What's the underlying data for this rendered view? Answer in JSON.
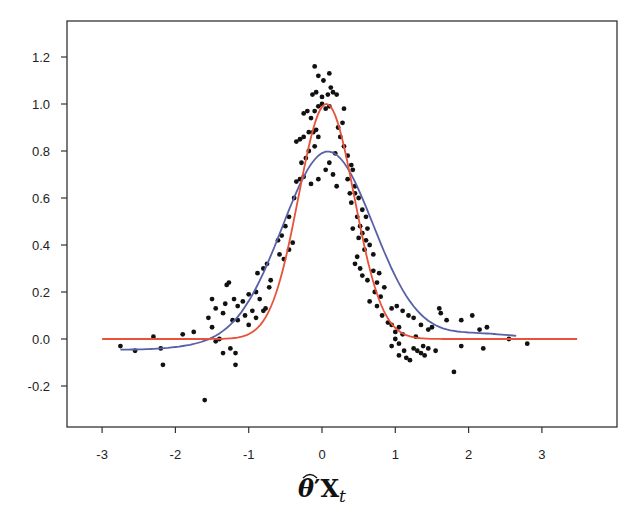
{
  "chart_data": {
    "type": "scatter",
    "title": "",
    "xlabel": "θ̂′X_t",
    "ylabel": "",
    "xlim": [
      -3.45,
      4.0
    ],
    "ylim": [
      -0.38,
      1.36
    ],
    "xticks": [
      -3,
      -2,
      -1,
      0,
      1,
      2,
      3
    ],
    "yticks": [
      -0.2,
      0.0,
      0.2,
      0.4,
      0.6,
      0.8,
      1.0,
      1.2
    ],
    "ytick_labels": [
      "-0.2",
      "0.0",
      "0.2",
      "0.4",
      "0.6",
      "0.8",
      "1.0",
      "1.2"
    ],
    "xtick_labels": [
      "-3",
      "-2",
      "-1",
      "0",
      "1",
      "2",
      "3"
    ],
    "grid": false,
    "legend": null,
    "series": [
      {
        "name": "observations",
        "kind": "scatter",
        "color": "#111111",
        "points": [
          [
            -2.75,
            -0.03
          ],
          [
            -2.55,
            -0.05
          ],
          [
            -2.3,
            0.01
          ],
          [
            -2.2,
            -0.04
          ],
          [
            -2.17,
            -0.11
          ],
          [
            -1.9,
            0.02
          ],
          [
            -1.6,
            -0.26
          ],
          [
            -1.75,
            0.03
          ],
          [
            -1.5,
            0.05
          ],
          [
            -1.45,
            -0.01
          ],
          [
            -1.4,
            0.0
          ],
          [
            -1.35,
            -0.06
          ],
          [
            -1.25,
            -0.04
          ],
          [
            -1.18,
            -0.06
          ],
          [
            -1.18,
            -0.11
          ],
          [
            -1.35,
            0.11
          ],
          [
            -1.2,
            0.17
          ],
          [
            -1.15,
            0.14
          ],
          [
            -1.08,
            0.16
          ],
          [
            -1.0,
            0.19
          ],
          [
            -0.9,
            0.2
          ],
          [
            -1.3,
            0.23
          ],
          [
            -1.27,
            0.24
          ],
          [
            -1.32,
            0.15
          ],
          [
            -1.22,
            0.08
          ],
          [
            -1.15,
            0.08
          ],
          [
            -1.05,
            0.1
          ],
          [
            -1.0,
            0.06
          ],
          [
            -0.95,
            0.12
          ],
          [
            -0.9,
            0.09
          ],
          [
            -1.5,
            0.17
          ],
          [
            -1.45,
            0.13
          ],
          [
            -1.55,
            0.09
          ],
          [
            -0.88,
            0.28
          ],
          [
            -0.8,
            0.3
          ],
          [
            -0.75,
            0.32
          ],
          [
            -0.7,
            0.25
          ],
          [
            -0.72,
            0.22
          ],
          [
            -0.85,
            0.17
          ],
          [
            -0.8,
            0.12
          ],
          [
            -0.77,
            0.13
          ],
          [
            -0.6,
            0.42
          ],
          [
            -0.55,
            0.44
          ],
          [
            -0.5,
            0.48
          ],
          [
            -0.58,
            0.36
          ],
          [
            -0.45,
            0.38
          ],
          [
            -0.4,
            0.41
          ],
          [
            -0.52,
            0.34
          ],
          [
            -0.45,
            0.52
          ],
          [
            -0.38,
            0.6
          ],
          [
            -0.35,
            0.67
          ],
          [
            -0.3,
            0.68
          ],
          [
            -0.25,
            0.69
          ],
          [
            -0.28,
            0.75
          ],
          [
            -0.22,
            0.77
          ],
          [
            -0.18,
            0.8
          ],
          [
            -0.1,
            0.82
          ],
          [
            -0.05,
            0.86
          ],
          [
            -0.18,
            0.88
          ],
          [
            -0.12,
            0.88
          ],
          [
            -0.08,
            0.89
          ],
          [
            -0.3,
            0.85
          ],
          [
            -0.25,
            0.86
          ],
          [
            -0.35,
            0.84
          ],
          [
            -0.15,
            0.94
          ],
          [
            -0.1,
            0.97
          ],
          [
            -0.05,
            0.99
          ],
          [
            0.0,
            1.0
          ],
          [
            -0.2,
            0.97
          ],
          [
            -0.25,
            0.96
          ],
          [
            0.05,
            0.98
          ],
          [
            0.1,
            0.99
          ],
          [
            -0.13,
            1.04
          ],
          [
            -0.08,
            1.05
          ],
          [
            0.0,
            1.03
          ],
          [
            0.08,
            1.04
          ],
          [
            0.12,
            1.07
          ],
          [
            0.2,
            1.04
          ],
          [
            -0.1,
            1.16
          ],
          [
            -0.05,
            1.12
          ],
          [
            0.02,
            1.1
          ],
          [
            0.1,
            1.13
          ],
          [
            0.15,
            1.05
          ],
          [
            0.3,
            0.98
          ],
          [
            0.28,
            0.92
          ],
          [
            0.22,
            0.9
          ],
          [
            0.25,
            0.86
          ],
          [
            0.3,
            0.82
          ],
          [
            0.35,
            0.78
          ],
          [
            0.18,
            0.79
          ],
          [
            0.05,
            0.72
          ],
          [
            0.1,
            0.75
          ],
          [
            0.15,
            0.7
          ],
          [
            -0.05,
            0.68
          ],
          [
            -0.15,
            0.66
          ],
          [
            0.2,
            0.65
          ],
          [
            0.35,
            0.68
          ],
          [
            0.4,
            0.74
          ],
          [
            0.42,
            0.72
          ],
          [
            0.45,
            0.65
          ],
          [
            0.38,
            0.62
          ],
          [
            0.45,
            0.62
          ],
          [
            0.5,
            0.6
          ],
          [
            0.4,
            0.58
          ],
          [
            0.55,
            0.55
          ],
          [
            0.48,
            0.52
          ],
          [
            0.6,
            0.52
          ],
          [
            0.52,
            0.48
          ],
          [
            0.62,
            0.47
          ],
          [
            0.55,
            0.45
          ],
          [
            0.6,
            0.42
          ],
          [
            0.65,
            0.4
          ],
          [
            0.58,
            0.38
          ],
          [
            0.7,
            0.36
          ],
          [
            0.42,
            0.47
          ],
          [
            0.5,
            0.43
          ],
          [
            0.48,
            0.35
          ],
          [
            0.45,
            0.32
          ],
          [
            0.52,
            0.3
          ],
          [
            0.55,
            0.27
          ],
          [
            0.62,
            0.25
          ],
          [
            0.7,
            0.29
          ],
          [
            0.78,
            0.28
          ],
          [
            0.75,
            0.24
          ],
          [
            0.85,
            0.22
          ],
          [
            0.8,
            0.18
          ],
          [
            0.72,
            0.2
          ],
          [
            0.65,
            0.16
          ],
          [
            0.75,
            0.14
          ],
          [
            0.82,
            0.1
          ],
          [
            0.9,
            0.07
          ],
          [
            0.95,
            0.06
          ],
          [
            1.0,
            0.03
          ],
          [
            1.05,
            0.05
          ],
          [
            1.1,
            0.02
          ],
          [
            0.95,
            0.13
          ],
          [
            1.02,
            0.14
          ],
          [
            1.1,
            0.12
          ],
          [
            1.18,
            0.1
          ],
          [
            1.25,
            0.09
          ],
          [
            1.35,
            0.06
          ],
          [
            1.45,
            0.04
          ],
          [
            1.5,
            0.05
          ],
          [
            1.6,
            0.13
          ],
          [
            1.62,
            0.11
          ],
          [
            1.7,
            0.08
          ],
          [
            1.9,
            0.08
          ],
          [
            2.05,
            0.1
          ],
          [
            2.15,
            0.04
          ],
          [
            2.25,
            0.05
          ],
          [
            2.55,
            0.0
          ],
          [
            2.8,
            -0.02
          ],
          [
            1.9,
            -0.03
          ],
          [
            2.2,
            -0.04
          ],
          [
            1.8,
            -0.14
          ],
          [
            1.55,
            -0.05
          ],
          [
            1.45,
            -0.04
          ],
          [
            1.38,
            -0.03
          ],
          [
            1.3,
            -0.05
          ],
          [
            1.25,
            -0.04
          ],
          [
            1.15,
            -0.08
          ],
          [
            1.05,
            -0.07
          ],
          [
            1.12,
            -0.05
          ],
          [
            0.95,
            -0.03
          ],
          [
            1.0,
            0.0
          ],
          [
            1.05,
            -0.02
          ],
          [
            1.28,
            0.01
          ],
          [
            1.35,
            -0.06
          ],
          [
            1.4,
            -0.07
          ],
          [
            1.2,
            -0.09
          ]
        ]
      },
      {
        "name": "blue-fit",
        "kind": "line",
        "color": "#5860a8",
        "points": [
          [
            -2.75,
            -0.04
          ],
          [
            -2.5,
            -0.035
          ],
          [
            -2.25,
            -0.025
          ],
          [
            -2.0,
            -0.005
          ],
          [
            -1.75,
            0.02
          ],
          [
            -1.5,
            0.06
          ],
          [
            -1.25,
            0.13
          ],
          [
            -1.0,
            0.24
          ],
          [
            -0.75,
            0.38
          ],
          [
            -0.5,
            0.55
          ],
          [
            -0.25,
            0.7
          ],
          [
            0.0,
            0.78
          ],
          [
            0.1,
            0.8
          ],
          [
            0.25,
            0.77
          ],
          [
            0.5,
            0.64
          ],
          [
            0.75,
            0.45
          ],
          [
            1.0,
            0.26
          ],
          [
            1.25,
            0.12
          ],
          [
            1.5,
            0.05
          ],
          [
            1.75,
            0.025
          ],
          [
            2.0,
            0.02
          ],
          [
            2.25,
            0.025
          ],
          [
            2.45,
            0.015
          ],
          [
            2.65,
            0.0
          ]
        ]
      },
      {
        "name": "red-fit",
        "kind": "line",
        "color": "#e8523a",
        "points": [
          [
            -3.0,
            0.0
          ],
          [
            -1.5,
            0.0
          ],
          [
            -1.0,
            0.01
          ],
          [
            -0.75,
            0.05
          ],
          [
            -0.5,
            0.24
          ],
          [
            -0.25,
            0.62
          ],
          [
            0.0,
            0.95
          ],
          [
            0.07,
            1.0
          ],
          [
            0.25,
            0.84
          ],
          [
            0.5,
            0.45
          ],
          [
            0.75,
            0.16
          ],
          [
            1.0,
            0.04
          ],
          [
            1.25,
            0.01
          ],
          [
            1.5,
            0.0
          ],
          [
            3.0,
            0.0
          ]
        ]
      }
    ]
  }
}
